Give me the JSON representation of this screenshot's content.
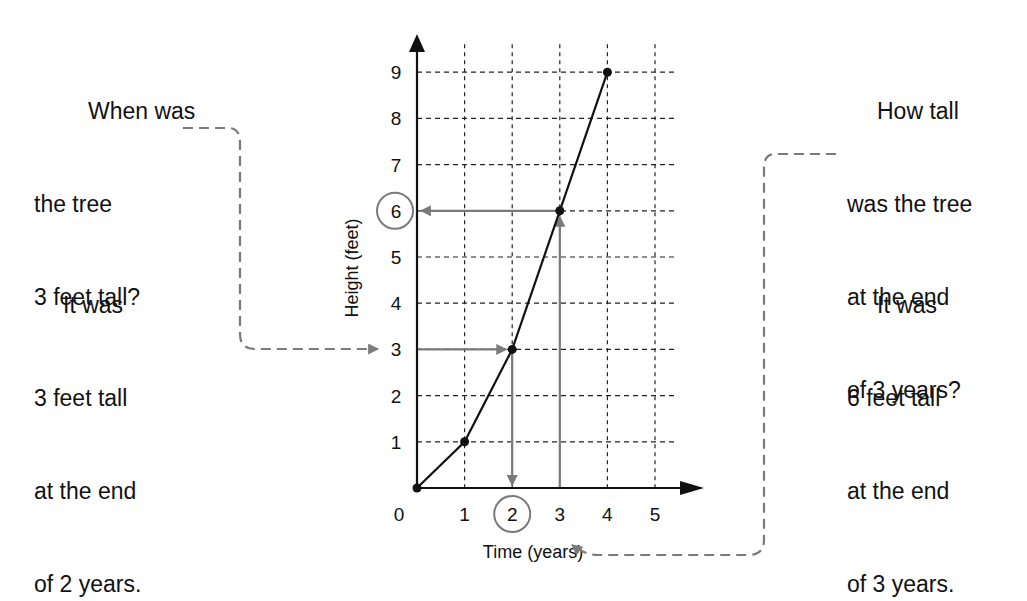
{
  "chart_data": {
    "type": "line",
    "title": "",
    "xlabel": "Time (years)",
    "ylabel": "Height (feet)",
    "x": [
      0,
      1,
      2,
      3,
      4
    ],
    "series": [
      {
        "name": "Tree height",
        "values": [
          0,
          1,
          3,
          6,
          9
        ]
      }
    ],
    "x_ticks": [
      "0",
      "1",
      "2",
      "3",
      "4",
      "5"
    ],
    "y_ticks": [
      "1",
      "2",
      "3",
      "4",
      "5",
      "6",
      "7",
      "8",
      "9"
    ],
    "xlim": [
      0,
      5
    ],
    "ylim": [
      0,
      9
    ],
    "grid": true,
    "grid_style": "dashed",
    "highlighted_x_tick": "2",
    "highlighted_y_tick": "6",
    "annotations": [
      {
        "question": [
          "When was",
          "the tree",
          "3 feet tall?"
        ],
        "answer": [
          "It was",
          "3 feet tall",
          "at the end",
          "of 2 years."
        ],
        "reads": "from y=3 across to curve, down to x=2"
      },
      {
        "question": [
          "How tall",
          "was the tree",
          "at the end",
          "of 3 years?"
        ],
        "answer": [
          "It was",
          "6 feet tall",
          "at the end",
          "of 3 years."
        ],
        "reads": "from x=3 up to curve, across to y=6"
      }
    ],
    "legend": "none"
  },
  "colors": {
    "ink": "#111111",
    "guide": "#7a7a7a",
    "grid": "#222222",
    "background": "#ffffff"
  }
}
